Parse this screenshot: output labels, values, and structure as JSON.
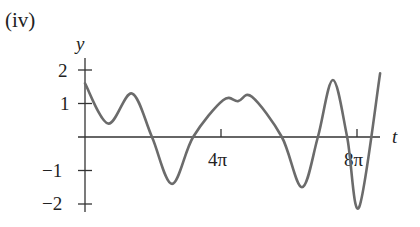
{
  "chart_data": {
    "type": "line",
    "panel_label": "(iv)",
    "title": "",
    "xlabel": "t",
    "ylabel": "y",
    "x_unit": "pi",
    "x_ticks": [
      {
        "value": 4,
        "label": "4π"
      },
      {
        "value": 8,
        "label": "8π"
      }
    ],
    "y_ticks": [
      {
        "value": 2,
        "label": "2"
      },
      {
        "value": 1,
        "label": "1"
      },
      {
        "value": -1,
        "label": "−1"
      },
      {
        "value": -2,
        "label": "−2"
      }
    ],
    "xlim": [
      0,
      8.75
    ],
    "ylim": [
      -2.2,
      2.1
    ],
    "grid": false,
    "legend": null,
    "series": [
      {
        "name": "y(t)",
        "color": "#666666",
        "x": [
          0,
          0.68,
          1.38,
          1.97,
          2.56,
          3.18,
          4.06,
          4.5,
          4.91,
          5.79,
          6.38,
          6.85,
          7.29,
          7.71,
          8.06,
          8.68
        ],
        "y": [
          1.6,
          0.4,
          1.3,
          0.0,
          -1.4,
          0.0,
          1.1,
          1.07,
          1.2,
          0.0,
          -1.5,
          0.0,
          1.7,
          0.0,
          -2.1,
          1.9
        ]
      }
    ]
  },
  "layout": {
    "origin_px": [
      85,
      137
    ],
    "px_per_pi": 34,
    "px_per_unit_y": 33.5,
    "axis_color": "#333333",
    "curve_color": "#6b6b6b"
  }
}
